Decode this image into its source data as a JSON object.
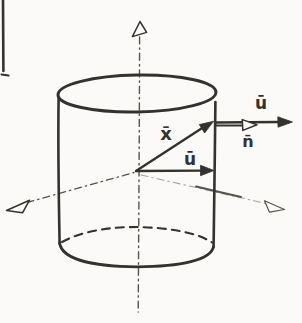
{
  "diagram": {
    "labels": {
      "x_vector": "x̄",
      "u_vector_inner": "ū",
      "u_vector_outer": "ū",
      "n_vector": "n̄"
    },
    "colors": {
      "ink": "#33322e",
      "ink_mid": "#55544c",
      "ink_light": "#a3a199",
      "paper": "#fbfaf8"
    }
  }
}
